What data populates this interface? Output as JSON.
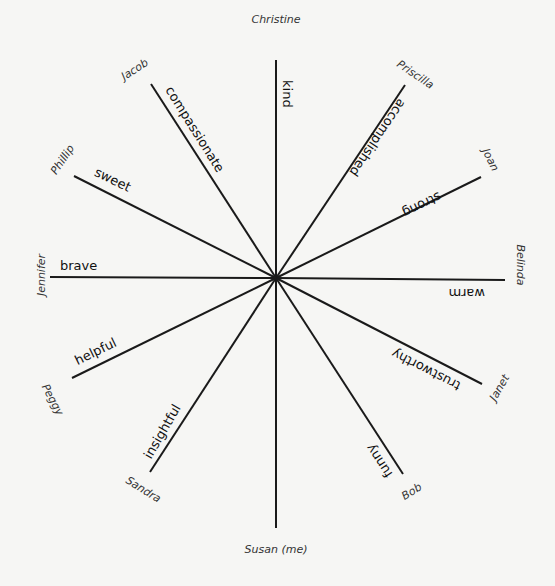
{
  "diagram": {
    "center": {
      "x": 276,
      "y": 278
    },
    "spokes": [
      {
        "name": "Christine",
        "trait": "kind",
        "x2": 276,
        "y2": 60,
        "name_x": 276,
        "name_y": 20,
        "name_rot": 0,
        "trait_x": 286,
        "trait_y": 80,
        "trait_rot": 90
      },
      {
        "name": "Priscilla",
        "trait": "accomplished",
        "x2": 405,
        "y2": 85,
        "name_x": 415,
        "name_y": 75,
        "name_rot": 34,
        "trait_x": 402,
        "trait_y": 100,
        "trait_rot": 124
      },
      {
        "name": "Joan",
        "trait": "strong",
        "x2": 481,
        "y2": 177,
        "name_x": 490,
        "name_y": 160,
        "name_rot": 64,
        "trait_x": 440,
        "trait_y": 195,
        "trait_rot": 154
      },
      {
        "name": "Belinda",
        "trait": "warm",
        "x2": 505,
        "y2": 280,
        "name_x": 520,
        "name_y": 265,
        "name_rot": 90,
        "trait_x": 485,
        "trait_y": 292,
        "trait_rot": 180
      },
      {
        "name": "Janet",
        "trait": "trustworthy",
        "x2": 482,
        "y2": 384,
        "name_x": 500,
        "name_y": 388,
        "name_rot": -60,
        "trait_x": 460,
        "trait_y": 386,
        "trait_rot": 207
      },
      {
        "name": "Bob",
        "trait": "funny",
        "x2": 403,
        "y2": 474,
        "name_x": 412,
        "name_y": 492,
        "name_rot": -32,
        "trait_x": 390,
        "trait_y": 476,
        "trait_rot": 237
      },
      {
        "name": "Susan (me)",
        "trait": "",
        "x2": 276,
        "y2": 528,
        "name_x": 276,
        "name_y": 550,
        "name_rot": 0
      },
      {
        "name": "Sandra",
        "trait": "insightful",
        "x2": 150,
        "y2": 472,
        "name_x": 143,
        "name_y": 490,
        "name_rot": 32,
        "trait_x": 148,
        "trait_y": 458,
        "trait_rot": -60
      },
      {
        "name": "Peggy",
        "trait": "helpful",
        "x2": 72,
        "y2": 378,
        "name_x": 52,
        "name_y": 400,
        "name_rot": 62,
        "trait_x": 76,
        "trait_y": 362,
        "trait_rot": -26
      },
      {
        "name": "Jennifer",
        "trait": "brave",
        "x2": 50,
        "y2": 277,
        "name_x": 42,
        "name_y": 275,
        "name_rot": -90,
        "trait_x": 60,
        "trait_y": 266,
        "trait_rot": 0
      },
      {
        "name": "Phillip",
        "trait": "sweet",
        "x2": 74,
        "y2": 176,
        "name_x": 63,
        "name_y": 160,
        "name_rot": -56,
        "trait_x": 95,
        "trait_y": 172,
        "trait_rot": 26
      },
      {
        "name": "Jacob",
        "trait": "compassionate",
        "x2": 151,
        "y2": 84,
        "name_x": 135,
        "name_y": 70,
        "name_rot": -33,
        "trait_x": 168,
        "trait_y": 88,
        "trait_rot": 58
      }
    ]
  }
}
